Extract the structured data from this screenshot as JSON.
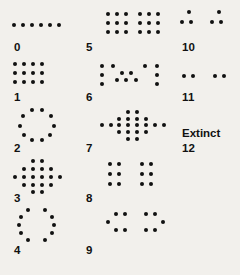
{
  "figure": {
    "background_color": "#f2f0ec",
    "dot_color": "#111111",
    "label_color": "#111111",
    "width": 240,
    "height": 275,
    "columns": 3,
    "rows": 5
  },
  "labels": {
    "l0": "0",
    "l1": "1",
    "l2": "2",
    "l3": "3",
    "l4": "4",
    "l5": "5",
    "l6": "6",
    "l7": "7",
    "l8": "8",
    "l9": "9",
    "l10": "10",
    "l11": "11",
    "l12": "12",
    "extinct": "Extinct"
  },
  "glyphs": [
    {
      "id": "glyph-0",
      "label": "0",
      "label_key": "l0",
      "dot_count": 6,
      "shape": "horizontal-row",
      "cell": {
        "x": 12,
        "y": 8,
        "w": 60,
        "h": 34
      },
      "label_pos": {
        "x": 14,
        "y": 42
      },
      "dots": [
        [
          2,
          17
        ],
        [
          11,
          17
        ],
        [
          20,
          17
        ],
        [
          29,
          17
        ],
        [
          38,
          17
        ],
        [
          47,
          17
        ]
      ]
    },
    {
      "id": "glyph-1",
      "label": "1",
      "label_key": "l1",
      "dot_count": 12,
      "shape": "rectangular-grid-4x3",
      "cell": {
        "x": 12,
        "y": 58,
        "w": 60,
        "h": 34
      },
      "label_pos": {
        "x": 14,
        "y": 92
      },
      "dots": [
        [
          3,
          6
        ],
        [
          12,
          6
        ],
        [
          21,
          6
        ],
        [
          30,
          6
        ],
        [
          3,
          15
        ],
        [
          12,
          15
        ],
        [
          21,
          15
        ],
        [
          30,
          15
        ],
        [
          3,
          24
        ],
        [
          12,
          24
        ],
        [
          21,
          24
        ],
        [
          30,
          24
        ]
      ]
    },
    {
      "id": "glyph-2",
      "label": "2",
      "label_key": "l2",
      "dot_count": 10,
      "shape": "ring",
      "cell": {
        "x": 12,
        "y": 108,
        "w": 60,
        "h": 36
      },
      "label_pos": {
        "x": 14,
        "y": 143
      },
      "dots": [
        [
          20,
          2
        ],
        [
          30,
          2
        ],
        [
          11,
          8
        ],
        [
          39,
          8
        ],
        [
          8,
          18
        ],
        [
          42,
          18
        ],
        [
          12,
          27
        ],
        [
          38,
          27
        ],
        [
          20,
          32
        ],
        [
          30,
          32
        ]
      ]
    },
    {
      "id": "glyph-3",
      "label": "3",
      "label_key": "l3",
      "dot_count": 21,
      "shape": "diamond-cluster",
      "cell": {
        "x": 12,
        "y": 158,
        "w": 60,
        "h": 36
      },
      "label_pos": {
        "x": 14,
        "y": 193
      },
      "dots": [
        [
          21,
          3
        ],
        [
          30,
          3
        ],
        [
          12,
          11
        ],
        [
          21,
          11
        ],
        [
          30,
          11
        ],
        [
          39,
          11
        ],
        [
          3,
          19
        ],
        [
          12,
          19
        ],
        [
          21,
          19
        ],
        [
          30,
          19
        ],
        [
          39,
          19
        ],
        [
          48,
          19
        ],
        [
          12,
          27
        ],
        [
          21,
          27
        ],
        [
          30,
          27
        ],
        [
          39,
          27
        ],
        [
          21,
          34
        ],
        [
          30,
          34
        ]
      ]
    },
    {
      "id": "glyph-4",
      "label": "4",
      "label_key": "l4",
      "dot_count": 12,
      "shape": "two-vertical-arcs",
      "cell": {
        "x": 12,
        "y": 208,
        "w": 60,
        "h": 38
      },
      "label_pos": {
        "x": 14,
        "y": 245
      },
      "dots": [
        [
          16,
          2
        ],
        [
          33,
          2
        ],
        [
          9,
          9
        ],
        [
          40,
          9
        ],
        [
          7,
          17
        ],
        [
          42,
          17
        ],
        [
          9,
          25
        ],
        [
          40,
          25
        ],
        [
          16,
          32
        ],
        [
          33,
          32
        ]
      ]
    },
    {
      "id": "glyph-5",
      "label": "5",
      "label_key": "l5",
      "dot_count": 18,
      "shape": "two-blocks-3x3",
      "cell": {
        "x": 104,
        "y": 8,
        "w": 60,
        "h": 34
      },
      "label_pos": {
        "x": 86,
        "y": 42
      },
      "dots": [
        [
          4,
          6
        ],
        [
          13,
          6
        ],
        [
          22,
          6
        ],
        [
          4,
          15
        ],
        [
          13,
          15
        ],
        [
          22,
          15
        ],
        [
          4,
          24
        ],
        [
          13,
          24
        ],
        [
          22,
          24
        ],
        [
          36,
          6
        ],
        [
          45,
          6
        ],
        [
          54,
          6
        ],
        [
          36,
          15
        ],
        [
          45,
          15
        ],
        [
          54,
          15
        ],
        [
          36,
          24
        ],
        [
          45,
          24
        ],
        [
          54,
          24
        ]
      ]
    },
    {
      "id": "glyph-6",
      "label": "6",
      "label_key": "l6",
      "dot_count": 14,
      "shape": "bars-with-center-cluster",
      "cell": {
        "x": 100,
        "y": 60,
        "w": 66,
        "h": 34
      },
      "label_pos": {
        "x": 86,
        "y": 92
      },
      "dots": [
        [
          2,
          6
        ],
        [
          2,
          15
        ],
        [
          2,
          24
        ],
        [
          57,
          6
        ],
        [
          57,
          15
        ],
        [
          57,
          24
        ],
        [
          22,
          13
        ],
        [
          31,
          13
        ],
        [
          17,
          20
        ],
        [
          26,
          20
        ],
        [
          36,
          20
        ],
        [
          13,
          6
        ],
        [
          45,
          6
        ]
      ]
    },
    {
      "id": "glyph-7",
      "label": "7",
      "label_key": "l7",
      "dot_count": 24,
      "shape": "wide-cluster",
      "cell": {
        "x": 100,
        "y": 110,
        "w": 72,
        "h": 34
      },
      "label_pos": {
        "x": 86,
        "y": 143
      },
      "dots": [
        [
          28,
          2
        ],
        [
          37,
          2
        ],
        [
          19,
          9
        ],
        [
          28,
          9
        ],
        [
          37,
          9
        ],
        [
          46,
          9
        ],
        [
          2,
          15
        ],
        [
          11,
          15
        ],
        [
          19,
          15
        ],
        [
          28,
          15
        ],
        [
          37,
          15
        ],
        [
          46,
          15
        ],
        [
          55,
          15
        ],
        [
          64,
          15
        ],
        [
          19,
          22
        ],
        [
          28,
          22
        ],
        [
          37,
          22
        ],
        [
          46,
          22
        ],
        [
          28,
          29
        ],
        [
          37,
          29
        ]
      ]
    },
    {
      "id": "glyph-8",
      "label": "8",
      "label_key": "l8",
      "dot_count": 12,
      "shape": "two-blocks-2x3",
      "cell": {
        "x": 106,
        "y": 160,
        "w": 60,
        "h": 34
      },
      "label_pos": {
        "x": 86,
        "y": 193
      },
      "dots": [
        [
          4,
          4
        ],
        [
          13,
          4
        ],
        [
          4,
          14
        ],
        [
          13,
          14
        ],
        [
          4,
          24
        ],
        [
          13,
          24
        ],
        [
          36,
          4
        ],
        [
          45,
          4
        ],
        [
          36,
          14
        ],
        [
          45,
          14
        ],
        [
          36,
          24
        ],
        [
          45,
          24
        ]
      ]
    },
    {
      "id": "glyph-9",
      "label": "9",
      "label_key": "l9",
      "dot_count": 10,
      "shape": "two-small-clusters",
      "cell": {
        "x": 106,
        "y": 212,
        "w": 60,
        "h": 32
      },
      "label_pos": {
        "x": 86,
        "y": 245
      },
      "dots": [
        [
          10,
          2
        ],
        [
          19,
          2
        ],
        [
          2,
          10
        ],
        [
          10,
          18
        ],
        [
          19,
          18
        ],
        [
          40,
          2
        ],
        [
          49,
          2
        ],
        [
          57,
          10
        ],
        [
          40,
          18
        ],
        [
          49,
          18
        ]
      ]
    },
    {
      "id": "glyph-10",
      "label": "10",
      "label_key": "l10",
      "dot_count": 6,
      "shape": "two-triplets",
      "cell": {
        "x": 182,
        "y": 10,
        "w": 54,
        "h": 30
      },
      "label_pos": {
        "x": 182,
        "y": 42
      },
      "dots": [
        [
          7,
          2
        ],
        [
          0,
          12
        ],
        [
          9,
          12
        ],
        [
          37,
          2
        ],
        [
          30,
          12
        ],
        [
          39,
          12
        ]
      ]
    },
    {
      "id": "glyph-11",
      "label": "11",
      "label_key": "l11",
      "dot_count": 4,
      "shape": "two-pairs",
      "cell": {
        "x": 182,
        "y": 68,
        "w": 54,
        "h": 24
      },
      "label_pos": {
        "x": 182,
        "y": 92
      },
      "dots": [
        [
          2,
          8
        ],
        [
          11,
          8
        ],
        [
          33,
          8
        ],
        [
          42,
          8
        ]
      ]
    },
    {
      "id": "glyph-12",
      "label": "12",
      "label_key": "l12",
      "dot_count": 0,
      "shape": "text-extinct",
      "text_key": "extinct",
      "cell": {
        "x": 182,
        "y": 118,
        "w": 56,
        "h": 24
      },
      "label_pos": {
        "x": 182,
        "y": 143
      },
      "text_pos": {
        "x": 182,
        "y": 128
      },
      "dots": []
    }
  ]
}
